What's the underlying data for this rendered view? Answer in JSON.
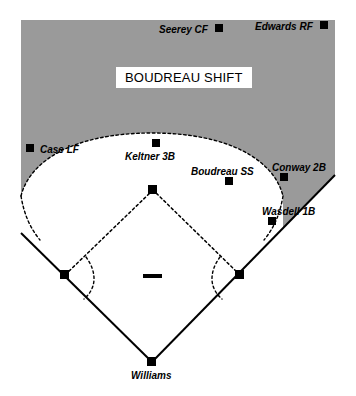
{
  "diagram": {
    "title": "BOUDREAU SHIFT",
    "colors": {
      "outfield_gray": "#9a9a9a",
      "infield_white": "#ffffff",
      "line_black": "#000000",
      "banner_background": "#ffffff"
    },
    "banner": {
      "label": "BOUDREAU SHIFT",
      "x": 116,
      "y": 67
    },
    "batter": {
      "name": "Williams",
      "marker_x": 152,
      "marker_y": 362,
      "label_x": 131,
      "label_y": 371
    },
    "fielders": [
      {
        "name": "Seerey CF",
        "position": "CF",
        "label_x": 159,
        "label_y": 24,
        "marker_x": 219,
        "marker_y": 28
      },
      {
        "name": "Edwards RF",
        "position": "RF",
        "label_x": 255,
        "label_y": 21,
        "marker_x": 324,
        "marker_y": 25
      },
      {
        "name": "Case LF",
        "position": "LF",
        "label_x": 40,
        "label_y": 145,
        "marker_x": 30,
        "marker_y": 148
      },
      {
        "name": "Keltner 3B",
        "position": "3B",
        "label_x": 125,
        "label_y": 152,
        "marker_x": 156,
        "marker_y": 143
      },
      {
        "name": "Boudreau SS",
        "position": "SS",
        "label_x": 191,
        "label_y": 167,
        "marker_x": 229,
        "marker_y": 181
      },
      {
        "name": "Conway 2B",
        "position": "2B",
        "label_x": 272,
        "label_y": 163,
        "marker_x": 284,
        "marker_y": 177
      },
      {
        "name": "Wasdell 1B",
        "position": "1B",
        "label_x": 262,
        "label_y": 207,
        "marker_x": 272,
        "marker_y": 221
      }
    ],
    "bases": [
      {
        "name": "home-plate",
        "x": 152,
        "y": 362
      },
      {
        "name": "first-base",
        "x": 240,
        "y": 275
      },
      {
        "name": "second-base",
        "x": 153,
        "y": 190
      },
      {
        "name": "third-base",
        "x": 65,
        "y": 275
      }
    ],
    "pitchers_mound": {
      "x": 152,
      "y": 277
    }
  }
}
